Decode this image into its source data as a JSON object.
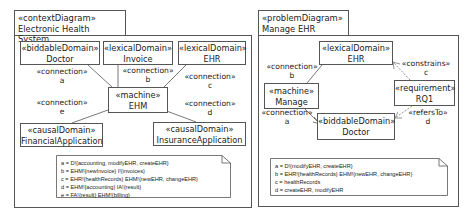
{
  "left_diagram": {
    "stereotype": "«contextDiagram»",
    "title": "Electronic Health System",
    "domains": [
      {
        "stereotype": "«biddableDomain»",
        "name": "Doctor"
      },
      {
        "stereotype": "«lexicalDomain»",
        "name": "Invoice"
      },
      {
        "stereotype": "«lexicalDomain»",
        "name": "EHR"
      },
      {
        "stereotype": "«machine»",
        "name": "EHM"
      },
      {
        "stereotype": "«causalDomain»",
        "name": "FinancialApplication"
      },
      {
        "stereotype": "«causalDomain»",
        "name": "InsuranceApplication"
      }
    ],
    "connections": [
      {
        "stereotype": "«connection»",
        "name": "a"
      },
      {
        "stereotype": "«connection»",
        "name": "b"
      },
      {
        "stereotype": "«connection»",
        "name": "c"
      },
      {
        "stereotype": "«connection»",
        "name": "d"
      },
      {
        "stereotype": "«connection»",
        "name": "e"
      }
    ],
    "note": [
      "a = D!{accounting, modifyEHR, createEHR}",
      "b = EHM!{newInvoice} I!{invoices}",
      "c = EHR!{healthRecords} EHM!{newEHR, changeEHR}",
      "d = EHM!{accounting} IA!{result}",
      "e = FA!{result} EHM!{billing}"
    ]
  },
  "right_diagram": {
    "stereotype": "«problemDiagram»",
    "title": "Manage EHR",
    "domains": [
      {
        "stereotype": "«lexicalDomain»",
        "name": "EHR"
      },
      {
        "stereotype": "«machine»",
        "name": "Manage"
      },
      {
        "stereotype": "«requirement»",
        "name": "RQ1"
      },
      {
        "stereotype": "«biddableDomain»",
        "name": "Doctor"
      }
    ],
    "connections": [
      {
        "stereotype": "«connection»",
        "name": "b"
      },
      {
        "stereotype": "«connection»",
        "name": "a"
      },
      {
        "stereotype": "«constrains»",
        "name": "c"
      },
      {
        "stereotype": "«refersTo»",
        "name": "d"
      }
    ],
    "note": [
      "a = D!{modifyEHR, createEHR}",
      "b = EHR!{healthRecords} EHM!{newEHR, changeEHR}",
      "c = healthRecords",
      "d = createEHR, modifyEHR"
    ]
  },
  "colors": {
    "line": "#555555",
    "dashed_line": "#777777",
    "background": "#ffffff"
  }
}
